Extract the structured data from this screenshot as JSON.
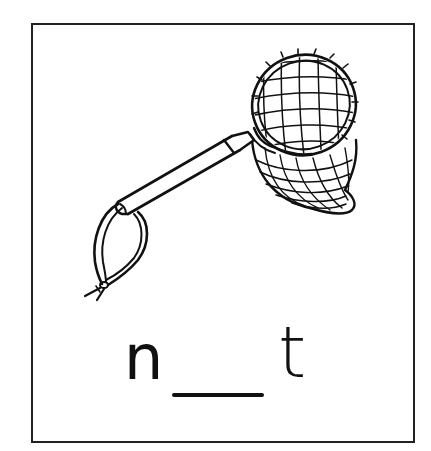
{
  "worksheet": {
    "type": "missing-letter word card",
    "picture": "butterfly-net",
    "word_parts": {
      "first_letter": "n",
      "blank": "___",
      "last_letter": "t"
    },
    "border_color": "#222222",
    "ink_color": "#111111",
    "background": "#ffffff"
  }
}
